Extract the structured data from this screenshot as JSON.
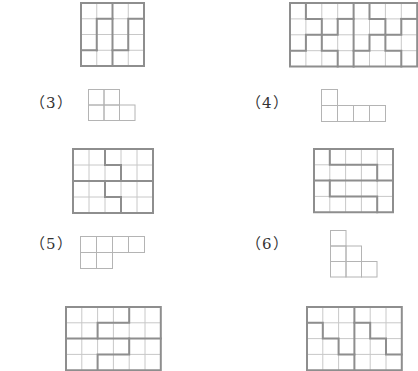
{
  "problems": [
    {
      "label": "",
      "id": "1",
      "grid": {
        "x": 80,
        "y": 2,
        "cols": 4,
        "rows": 4,
        "cell": 15.75,
        "partition": [
          [
            [
              0,
              0
            ],
            [
              4,
              0
            ],
            [
              4,
              4
            ],
            [
              0,
              4
            ],
            [
              0,
              0
            ]
          ],
          [
            [
              2,
              0
            ],
            [
              2,
              1
            ]
          ],
          [
            [
              1,
              3
            ],
            [
              1,
              1
            ],
            [
              2,
              1
            ],
            [
              2,
              4
            ]
          ],
          [
            [
              0,
              3
            ],
            [
              1,
              3
            ]
          ],
          [
            [
              2,
              3
            ],
            [
              3,
              3
            ],
            [
              3,
              1
            ],
            [
              4,
              1
            ]
          ]
        ]
      }
    },
    {
      "label": "",
      "id": "2",
      "grid": {
        "x": 289,
        "y": 2,
        "cols": 8,
        "rows": 4,
        "cell": 15.9,
        "partition": [
          [
            [
              0,
              0
            ],
            [
              8,
              0
            ],
            [
              8,
              4
            ],
            [
              0,
              4
            ],
            [
              0,
              0
            ]
          ],
          [
            [
              1,
              0
            ],
            [
              1,
              1
            ],
            [
              2,
              1
            ],
            [
              2,
              2
            ],
            [
              1,
              2
            ],
            [
              1,
              3
            ],
            [
              0,
              3
            ]
          ],
          [
            [
              3,
              1
            ],
            [
              3,
              2
            ],
            [
              2,
              2
            ],
            [
              2,
              3
            ],
            [
              3,
              3
            ],
            [
              3,
              4
            ]
          ],
          [
            [
              4,
              0
            ],
            [
              4,
              4
            ]
          ],
          [
            [
              3,
              1
            ],
            [
              4,
              1
            ]
          ],
          [
            [
              5,
              0
            ],
            [
              5,
              1
            ],
            [
              6,
              1
            ],
            [
              6,
              2
            ],
            [
              5,
              2
            ],
            [
              5,
              3
            ],
            [
              4,
              3
            ]
          ],
          [
            [
              7,
              1
            ],
            [
              7,
              2
            ],
            [
              6,
              2
            ],
            [
              6,
              3
            ],
            [
              7,
              3
            ],
            [
              7,
              4
            ]
          ],
          [
            [
              7,
              1
            ],
            [
              8,
              1
            ]
          ]
        ]
      }
    },
    {
      "label": "（3）",
      "id": "3",
      "label_pos": {
        "x": 30,
        "y": 91
      },
      "piece": {
        "x": 88,
        "y": 89,
        "cell": 15.5,
        "cells": [
          [
            0,
            0
          ],
          [
            1,
            0
          ],
          [
            0,
            1
          ],
          [
            1,
            1
          ],
          [
            2,
            1
          ]
        ]
      },
      "grid": {
        "x": 72,
        "y": 148,
        "cols": 5,
        "rows": 4,
        "cell": 16,
        "partition": [
          [
            [
              0,
              0
            ],
            [
              5,
              0
            ],
            [
              5,
              4
            ],
            [
              0,
              4
            ],
            [
              0,
              0
            ]
          ],
          [
            [
              2,
              0
            ],
            [
              2,
              1
            ],
            [
              3,
              1
            ],
            [
              3,
              2
            ]
          ],
          [
            [
              0,
              2
            ],
            [
              5,
              2
            ]
          ],
          [
            [
              2,
              2
            ],
            [
              2,
              3
            ],
            [
              3,
              3
            ],
            [
              3,
              4
            ]
          ]
        ]
      }
    },
    {
      "label": "（4）",
      "id": "4",
      "label_pos": {
        "x": 246,
        "y": 91
      },
      "piece": {
        "x": 321,
        "y": 89,
        "cell": 16,
        "cells": [
          [
            0,
            0
          ],
          [
            0,
            1
          ],
          [
            1,
            1
          ],
          [
            2,
            1
          ],
          [
            3,
            1
          ]
        ]
      },
      "grid": {
        "x": 313,
        "y": 148,
        "cols": 5,
        "rows": 4,
        "cell": 15.8,
        "partition": [
          [
            [
              0,
              0
            ],
            [
              5,
              0
            ],
            [
              5,
              4
            ],
            [
              0,
              4
            ],
            [
              0,
              0
            ]
          ],
          [
            [
              1,
              0
            ],
            [
              1,
              1
            ],
            [
              4,
              1
            ],
            [
              4,
              2
            ]
          ],
          [
            [
              0,
              2
            ],
            [
              5,
              2
            ]
          ],
          [
            [
              1,
              2
            ],
            [
              1,
              3
            ],
            [
              4,
              3
            ],
            [
              4,
              4
            ]
          ]
        ]
      }
    },
    {
      "label": "（5）",
      "id": "5",
      "label_pos": {
        "x": 30,
        "y": 232
      },
      "piece": {
        "x": 80,
        "y": 236,
        "cell": 16,
        "cells": [
          [
            0,
            0
          ],
          [
            1,
            0
          ],
          [
            2,
            0
          ],
          [
            3,
            0
          ],
          [
            0,
            1
          ],
          [
            1,
            1
          ]
        ]
      },
      "grid": {
        "x": 65,
        "y": 306,
        "cols": 6,
        "rows": 4,
        "cell": 15.8,
        "partition": [
          [
            [
              0,
              0
            ],
            [
              6,
              0
            ],
            [
              6,
              4
            ],
            [
              0,
              4
            ],
            [
              0,
              0
            ]
          ],
          [
            [
              4,
              0
            ],
            [
              4,
              1
            ],
            [
              2,
              1
            ],
            [
              2,
              2
            ]
          ],
          [
            [
              0,
              2
            ],
            [
              6,
              2
            ]
          ],
          [
            [
              4,
              2
            ],
            [
              4,
              3
            ],
            [
              2,
              3
            ],
            [
              2,
              4
            ]
          ]
        ]
      }
    },
    {
      "label": "（6）",
      "id": "6",
      "label_pos": {
        "x": 246,
        "y": 232
      },
      "piece": {
        "x": 330,
        "y": 230,
        "cell": 15.5,
        "cells": [
          [
            0,
            0
          ],
          [
            0,
            1
          ],
          [
            1,
            1
          ],
          [
            0,
            2
          ],
          [
            1,
            2
          ],
          [
            2,
            2
          ]
        ]
      },
      "grid": {
        "x": 306,
        "y": 306,
        "cols": 6,
        "rows": 4,
        "cell": 15.8,
        "partition": [
          [
            [
              0,
              0
            ],
            [
              6,
              0
            ],
            [
              6,
              4
            ],
            [
              0,
              4
            ],
            [
              0,
              0
            ]
          ],
          [
            [
              3,
              0
            ],
            [
              3,
              4
            ]
          ],
          [
            [
              0,
              1
            ],
            [
              1,
              1
            ],
            [
              1,
              2
            ],
            [
              2,
              2
            ],
            [
              2,
              3
            ],
            [
              3,
              3
            ]
          ],
          [
            [
              3,
              1
            ],
            [
              4,
              1
            ],
            [
              4,
              2
            ],
            [
              5,
              2
            ],
            [
              5,
              3
            ],
            [
              6,
              3
            ]
          ]
        ]
      }
    }
  ],
  "colors": {
    "thin_line": "#c8c8c8",
    "thick_line": "#8e8e8e",
    "piece_line": "#b4b4b4",
    "label": "#333333"
  }
}
